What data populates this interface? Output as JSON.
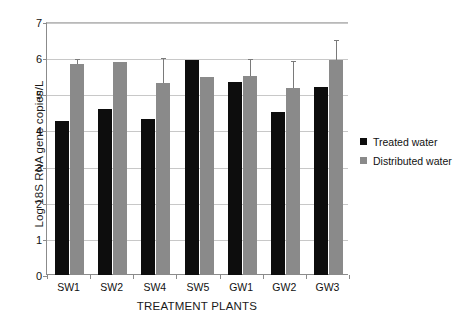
{
  "chart_data": {
    "type": "bar",
    "title": "",
    "xlabel": "TREATMENT PLANTS",
    "ylabel": "Log 18S RNA gene copies/L",
    "ylim": [
      0,
      7
    ],
    "yticks": [
      0,
      1,
      2,
      3,
      4,
      5,
      6,
      7
    ],
    "ytick_labels": [
      "0",
      "1",
      "2",
      "3",
      "4",
      "5",
      "6",
      "7"
    ],
    "grid": true,
    "legend_position": "right",
    "categories": [
      "SW1",
      "SW2",
      "SW4",
      "SW5",
      "GW1",
      "GW2",
      "GW3"
    ],
    "series": [
      {
        "name": "Treated water",
        "color": "#0d0d0d",
        "values": [
          4.25,
          4.6,
          4.33,
          5.95,
          5.35,
          4.5,
          5.2
        ],
        "errors_upper": [
          null,
          null,
          null,
          null,
          null,
          null,
          null
        ]
      },
      {
        "name": "Distributed water",
        "color": "#8a8a8a",
        "values": [
          5.85,
          5.9,
          5.3,
          5.47,
          5.5,
          5.18,
          5.95
        ],
        "errors_upper": [
          5.97,
          null,
          6.0,
          null,
          5.97,
          5.93,
          6.5
        ]
      }
    ]
  },
  "legend": {
    "items": [
      {
        "label": "Treated water",
        "color": "#0d0d0d"
      },
      {
        "label": "Distributed water",
        "color": "#8a8a8a"
      }
    ]
  }
}
